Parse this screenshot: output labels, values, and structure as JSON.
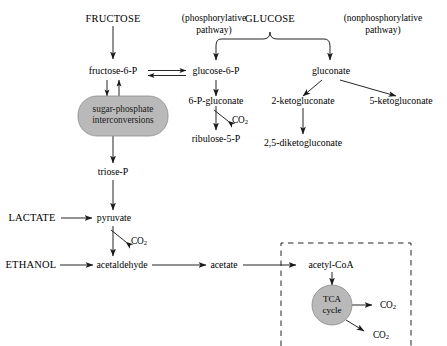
{
  "diagram": {
    "type": "metabolic-pathway-flowchart",
    "colors": {
      "stroke": "#1a1a1a",
      "text": "#000000",
      "shape_fill": "#b9b9b9",
      "shape_stroke": "#8c8c8c",
      "background": "#ffffff"
    }
  },
  "nodes": {
    "fructose": "FRUCTOSE",
    "glucose": "GLUCOSE",
    "phosphorylative_pathway_l1": "(phosphorylative",
    "phosphorylative_pathway_l2": "pathway)",
    "nonphosphorylative_pathway_l1": "(nonphosphorylative",
    "nonphosphorylative_pathway_l2": "pathway)",
    "fructose_6p": "fructose-6-P",
    "glucose_6p": "glucose-6-P",
    "gluconate": "gluconate",
    "six_p_gluconate": "6-P-gluconate",
    "two_ketogluconate": "2-ketogluconate",
    "five_ketogluconate": "5-ketogluconate",
    "ribulose_5p": "ribulose-5-P",
    "diketogluconate": "2,5-diketogluconate",
    "sugar_phosphate_l1": "sugar-phosphate",
    "sugar_phosphate_l2": "interconversions",
    "triose_p": "triose-P",
    "lactate": "LACTATE",
    "pyruvate": "pyruvate",
    "ethanol": "ETHANOL",
    "acetaldehyde": "acetaldehyde",
    "acetate": "acetate",
    "acetyl_coa": "acetyl-CoA",
    "tca_l1": "TCA",
    "tca_l2": "cycle",
    "co2_pentose": "CO",
    "co2_pentose_sub": "2",
    "co2_pyruvate": "CO",
    "co2_pyruvate_sub": "2",
    "co2_tca_right": "CO",
    "co2_tca_right_sub": "2",
    "co2_tca_lower": "CO",
    "co2_tca_lower_sub": "2"
  }
}
